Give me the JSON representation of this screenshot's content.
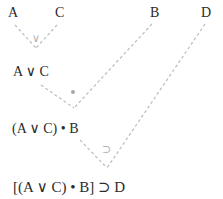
{
  "atoms": {
    "a": "A",
    "c": "C",
    "b": "B",
    "d": "D"
  },
  "nodes": {
    "a_or_c": "A ∨ C",
    "and_b": "(A ∨ C) • B",
    "final": "[(A ∨ C) • B] ⊃ D"
  },
  "operators": {
    "or": "∨",
    "dot": "•",
    "implies": "⊃"
  },
  "colors": {
    "text": "#2b2b2b",
    "connector": "#bdbdbd",
    "operator": "#b0b0b0"
  }
}
